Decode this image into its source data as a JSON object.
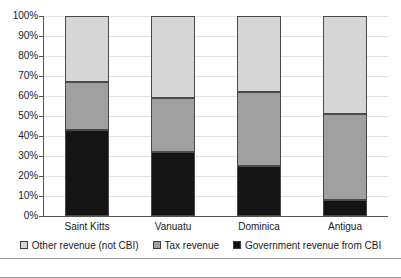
{
  "chart_data": {
    "type": "bar",
    "subtype": "stacked-100-percent",
    "title": "",
    "xlabel": "",
    "ylabel": "",
    "ylim": [
      0,
      100
    ],
    "grid": true,
    "legend_position": "bottom",
    "categories": [
      "Saint Kitts",
      "Vanuatu",
      "Dominica",
      "Antigua"
    ],
    "y_tick_labels": [
      "0%",
      "10%",
      "20%",
      "30%",
      "40%",
      "50%",
      "60%",
      "70%",
      "80%",
      "90%",
      "100%"
    ],
    "y_tick_values": [
      0,
      10,
      20,
      30,
      40,
      50,
      60,
      70,
      80,
      90,
      100
    ],
    "series": [
      {
        "name": "Government revenue from CBI",
        "color": "#141414",
        "values": [
          43,
          32,
          25,
          8
        ]
      },
      {
        "name": "Tax revenue",
        "color": "#a0a0a0",
        "values": [
          24,
          27,
          37,
          43
        ]
      },
      {
        "name": "Other revenue (not CBI)",
        "color": "#d6d6d6",
        "values": [
          33,
          41,
          38,
          49
        ]
      }
    ]
  },
  "legend": {
    "items": [
      {
        "label": "Other revenue (not CBI)",
        "swatch": "swatch-other"
      },
      {
        "label": "Tax revenue",
        "swatch": "swatch-tax"
      },
      {
        "label": "Government revenue from CBI",
        "swatch": "swatch-cbi"
      }
    ]
  },
  "footer": {
    "caption": ""
  }
}
